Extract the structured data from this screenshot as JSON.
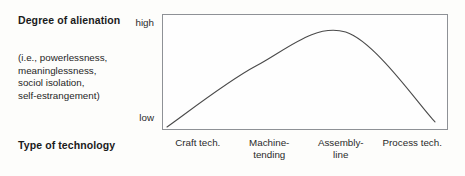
{
  "figure": {
    "y_axis": {
      "title": "Degree of alienation",
      "gloss_lines": [
        "(i.e., powerlessness,",
        "meaninglessness,",
        "sociol isolation,",
        "self-estrangement)"
      ],
      "tick_high": "high",
      "tick_low": "low"
    },
    "x_axis": {
      "title": "Type of technology",
      "tick_labels": [
        [
          "Craft tech."
        ],
        [
          "Machine-",
          "tending"
        ],
        [
          "Assembly-",
          "line"
        ],
        [
          "Process tech."
        ]
      ]
    },
    "colors": {
      "frame": "#8e9196",
      "curve": "#4a4a4a",
      "text": "#1b1b1b",
      "background": "#fdfdfb",
      "plot_background": "#fefefe"
    }
  },
  "chart_data": {
    "type": "line",
    "title": "",
    "xlabel": "Type of technology",
    "ylabel": "Degree of alienation (i.e., powerlessness, meaninglessness, sociol isolation, self-estrangement)",
    "categories": [
      "Craft tech.",
      "Machine-tending",
      "Assembly-line",
      "Process tech."
    ],
    "x": [
      0,
      1,
      2,
      3
    ],
    "y": [
      0.02,
      0.62,
      0.95,
      0.07
    ],
    "ytick_labels": [
      "low",
      "high"
    ],
    "ylim": [
      0,
      1
    ],
    "grid": false,
    "legend": null,
    "annotations": [],
    "shape": "inverted-u"
  }
}
